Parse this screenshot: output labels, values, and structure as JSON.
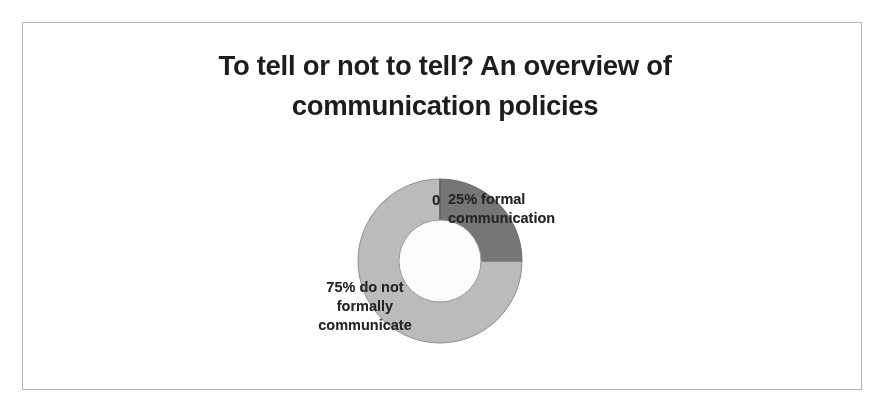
{
  "slide": {
    "background_color": "#ffffff",
    "frame_color": "#b5b5b5",
    "title_line1": "To tell or not to tell? An overview of",
    "title_line2": "communication policies"
  },
  "chart_data": {
    "type": "pie",
    "variant": "donut",
    "title": "To tell or not to tell? An overview of communication policies",
    "subtitle": "",
    "xlabel": "",
    "ylabel": "",
    "legend_position": "none",
    "grid": false,
    "hole_fraction": 0.5,
    "start_angle_deg": 0,
    "direction": "clockwise",
    "categories": [
      "25% formal communication",
      "75% do not formally communicate"
    ],
    "values": [
      25,
      75
    ],
    "unit": "percent",
    "colors": [
      "#747474",
      "#bcbcbc"
    ],
    "slices": [
      {
        "label": "25% formal communication",
        "value": 25,
        "percent": "25%",
        "color": "#747474",
        "start_angle_deg": 0,
        "end_angle_deg": 90
      },
      {
        "label": "75% do not formally communicate",
        "value": 75,
        "percent": "75%",
        "color": "#bcbcbc",
        "start_angle_deg": 90,
        "end_angle_deg": 360
      }
    ],
    "annotations": [
      {
        "name": "series-marker",
        "text": "0"
      }
    ],
    "data_labels": {
      "stray_zero": "0",
      "formal_line1": "25% formal",
      "formal_line2": "communication",
      "informal_line1": "75% do not",
      "informal_line2": "formally",
      "informal_line3": "communicate"
    }
  }
}
